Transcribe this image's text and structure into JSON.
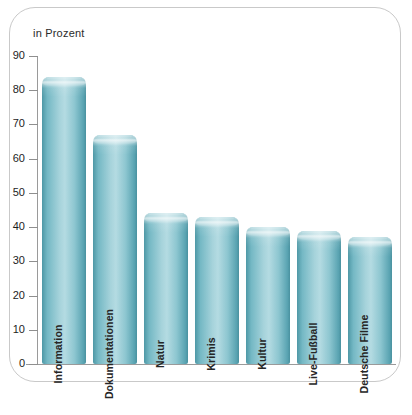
{
  "axis_title": "in Prozent",
  "colors": {
    "bar_edge": "#4e98a6",
    "bar_center": "#b4dbe2",
    "axis": "#9a9a9a",
    "frame": "#c9c9c9",
    "text": "#262626",
    "background": "#ffffff"
  },
  "chart_data": {
    "type": "bar",
    "title": "in Prozent",
    "xlabel": "",
    "ylabel": "in Prozent",
    "ylim": [
      0,
      90
    ],
    "yticks": [
      0,
      10,
      20,
      30,
      40,
      50,
      60,
      70,
      80,
      90
    ],
    "grid": false,
    "legend": "none",
    "orientation": "vertical",
    "label_position": "inside-bar-rotated",
    "categories": [
      "Information",
      "Dokumentationen",
      "Natur",
      "Krimis",
      "Kultur",
      "Live-Fußball",
      "Deutsche Filme"
    ],
    "values": [
      84,
      67,
      44,
      43,
      40,
      39,
      37
    ]
  }
}
